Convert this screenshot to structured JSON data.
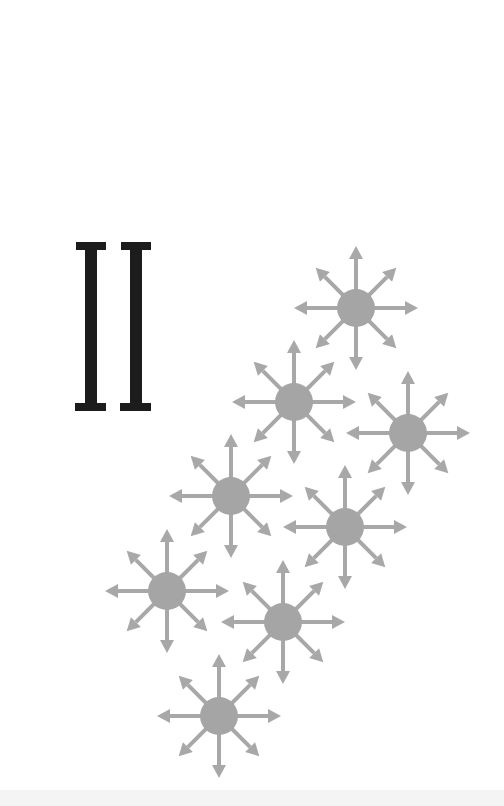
{
  "figure": {
    "label": "II",
    "label_color": "#1c1c1c",
    "particle_color": "#a8a8a8",
    "circle_color": "#a5a5a5",
    "particle_count": 8,
    "particles": [
      {
        "x": 356,
        "y": 308
      },
      {
        "x": 294,
        "y": 402
      },
      {
        "x": 408,
        "y": 433
      },
      {
        "x": 231,
        "y": 496
      },
      {
        "x": 345,
        "y": 527
      },
      {
        "x": 167,
        "y": 591
      },
      {
        "x": 283,
        "y": 622
      },
      {
        "x": 219,
        "y": 716
      }
    ],
    "arrow_directions": 8
  }
}
